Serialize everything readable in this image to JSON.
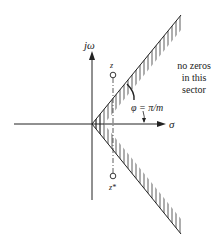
{
  "figure": {
    "axes": {
      "vertical_label": "jω",
      "horizontal_label": "σ"
    },
    "zeros": {
      "upper_label": "z",
      "lower_label": "z*"
    },
    "angle_label": "φ = π/m",
    "sector_note": {
      "line1": "no zeros",
      "line2": "in this",
      "line3": "sector"
    },
    "colors": {
      "ink": "#222222",
      "background": "#ffffff"
    }
  }
}
